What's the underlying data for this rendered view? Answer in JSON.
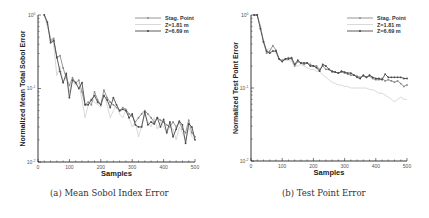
{
  "captions": {
    "a": "(a) Mean Sobol Index Error",
    "b": "(b) Test Point Error"
  },
  "legend": [
    "Stag. Point",
    "Z=1.81 m",
    "Z=6.69 m"
  ],
  "colors": {
    "stag_point": "#8a8a8a",
    "z181": "#c8c8c8",
    "z669": "#4a4a4a",
    "axis": "#222222"
  },
  "chart_data": [
    {
      "type": "line",
      "title": "(a) Mean Sobol Index Error",
      "xlabel": "Samples",
      "ylabel": "Normalized Mean Total Sobol Error",
      "xlim": [
        0,
        500
      ],
      "ylim": [
        0.01,
        1
      ],
      "yscale": "log",
      "xticks": [
        0,
        100,
        200,
        300,
        400,
        500
      ],
      "yticks": [
        "10^-2",
        "10^-1",
        "10^0"
      ],
      "legend_position": "upper right",
      "grid": false,
      "x": [
        20,
        30,
        40,
        50,
        60,
        70,
        80,
        90,
        100,
        110,
        120,
        130,
        140,
        150,
        160,
        170,
        180,
        190,
        200,
        210,
        220,
        230,
        240,
        250,
        260,
        270,
        280,
        290,
        300,
        310,
        320,
        330,
        340,
        350,
        360,
        370,
        380,
        390,
        400,
        410,
        420,
        430,
        440,
        450,
        460,
        470,
        480,
        490,
        500
      ],
      "series": [
        {
          "name": "Stag. Point",
          "values": [
            1.0,
            0.75,
            0.45,
            0.48,
            0.26,
            0.28,
            0.19,
            0.14,
            0.11,
            0.14,
            0.12,
            0.13,
            0.09,
            0.06,
            0.065,
            0.06,
            0.09,
            0.07,
            0.06,
            0.095,
            0.075,
            0.065,
            0.06,
            0.055,
            0.05,
            0.055,
            0.052,
            0.045,
            0.042,
            0.035,
            0.04,
            0.045,
            0.05,
            0.045,
            0.04,
            0.035,
            0.04,
            0.037,
            0.035,
            0.032,
            0.03,
            0.035,
            0.03,
            0.035,
            0.028,
            0.025,
            0.037,
            0.025,
            0.022
          ]
        },
        {
          "name": "Z=1.81 m",
          "values": [
            1.0,
            0.7,
            0.5,
            0.4,
            0.15,
            0.2,
            0.12,
            0.15,
            0.09,
            0.13,
            0.11,
            0.12,
            0.07,
            0.04,
            0.06,
            0.075,
            0.065,
            0.06,
            0.055,
            0.085,
            0.06,
            0.04,
            0.05,
            0.06,
            0.045,
            0.04,
            0.05,
            0.04,
            0.03,
            0.035,
            0.022,
            0.03,
            0.045,
            0.035,
            0.03,
            0.04,
            0.028,
            0.035,
            0.03,
            0.025,
            0.03,
            0.028,
            0.02,
            0.03,
            0.025,
            0.02,
            0.03,
            0.022,
            0.02
          ]
        },
        {
          "name": "Z=6.69 m",
          "values": [
            1.0,
            0.8,
            0.42,
            0.45,
            0.27,
            0.17,
            0.12,
            0.16,
            0.075,
            0.13,
            0.12,
            0.1,
            0.12,
            0.06,
            0.06,
            0.07,
            0.08,
            0.065,
            0.06,
            0.08,
            0.07,
            0.055,
            0.075,
            0.06,
            0.05,
            0.052,
            0.05,
            0.04,
            0.045,
            0.032,
            0.03,
            0.03,
            0.048,
            0.032,
            0.035,
            0.033,
            0.04,
            0.03,
            0.038,
            0.025,
            0.035,
            0.022,
            0.028,
            0.036,
            0.032,
            0.018,
            0.033,
            0.03,
            0.02
          ]
        }
      ]
    },
    {
      "type": "line",
      "title": "(b) Test Point Error",
      "xlabel": "Samples",
      "ylabel": "Normalized Test Point Error",
      "xlim": [
        0,
        500
      ],
      "ylim": [
        0.01,
        1
      ],
      "yscale": "log",
      "xticks": [
        0,
        100,
        200,
        300,
        400,
        500
      ],
      "yticks": [
        "10^-2",
        "10^-1",
        "10^0"
      ],
      "legend_position": "upper right",
      "grid": false,
      "x": [
        10,
        20,
        30,
        40,
        50,
        60,
        70,
        80,
        90,
        100,
        110,
        120,
        130,
        140,
        150,
        160,
        170,
        180,
        190,
        200,
        210,
        220,
        230,
        240,
        250,
        260,
        270,
        280,
        290,
        300,
        310,
        320,
        330,
        340,
        350,
        360,
        370,
        380,
        390,
        400,
        410,
        420,
        430,
        440,
        450,
        460,
        470,
        480,
        490,
        500
      ],
      "series": [
        {
          "name": "Stag. Point",
          "values": [
            1.0,
            1.0,
            0.7,
            0.43,
            0.3,
            0.32,
            0.38,
            0.33,
            0.25,
            0.24,
            0.25,
            0.26,
            0.25,
            0.2,
            0.23,
            0.22,
            0.21,
            0.22,
            0.21,
            0.2,
            0.2,
            0.18,
            0.2,
            0.18,
            0.18,
            0.165,
            0.165,
            0.16,
            0.165,
            0.16,
            0.155,
            0.15,
            0.15,
            0.145,
            0.14,
            0.145,
            0.14,
            0.145,
            0.135,
            0.13,
            0.13,
            0.135,
            0.125,
            0.13,
            0.125,
            0.12,
            0.125,
            0.115,
            0.105,
            0.11
          ]
        },
        {
          "name": "Z=1.81 m",
          "values": [
            1.0,
            1.0,
            0.7,
            0.45,
            0.33,
            0.35,
            0.33,
            0.3,
            0.24,
            0.23,
            0.24,
            0.24,
            0.23,
            0.2,
            0.2,
            0.21,
            0.2,
            0.19,
            0.18,
            0.18,
            0.17,
            0.17,
            0.15,
            0.14,
            0.13,
            0.12,
            0.115,
            0.11,
            0.11,
            0.105,
            0.105,
            0.1,
            0.1,
            0.1,
            0.1,
            0.1,
            0.1,
            0.095,
            0.095,
            0.09,
            0.085,
            0.085,
            0.08,
            0.075,
            0.07,
            0.065,
            0.07,
            0.075,
            0.07,
            0.07
          ]
        },
        {
          "name": "Z=6.69 m",
          "values": [
            1.0,
            1.0,
            0.65,
            0.43,
            0.32,
            0.3,
            0.32,
            0.32,
            0.25,
            0.23,
            0.25,
            0.25,
            0.26,
            0.21,
            0.24,
            0.22,
            0.22,
            0.22,
            0.2,
            0.2,
            0.19,
            0.17,
            0.21,
            0.2,
            0.18,
            0.17,
            0.165,
            0.16,
            0.17,
            0.165,
            0.16,
            0.16,
            0.15,
            0.14,
            0.135,
            0.15,
            0.14,
            0.15,
            0.14,
            0.135,
            0.135,
            0.13,
            0.155,
            0.14,
            0.14,
            0.14,
            0.14,
            0.14,
            0.135,
            0.135
          ]
        }
      ]
    }
  ]
}
